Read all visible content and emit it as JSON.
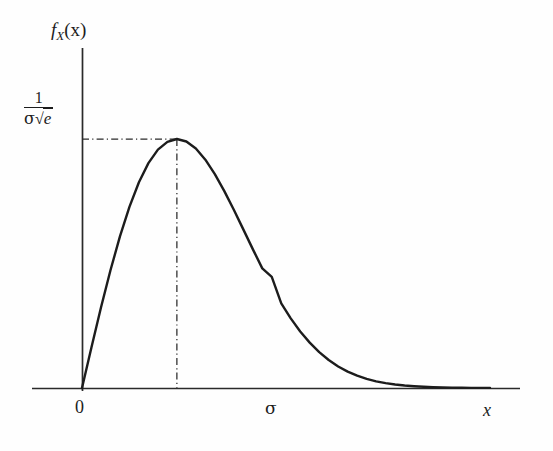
{
  "figure": {
    "background_color": "#fefefe",
    "ink_color": "#1c1c1c",
    "width": 553,
    "height": 451
  },
  "axes": {
    "y_axis_label": "f_X(x)",
    "y_axis_label_parts": {
      "f": "f",
      "subscript": "X",
      "argument": "(x)"
    },
    "x_axis_label": "x",
    "x_tick_labels": [
      "0",
      "σ"
    ],
    "y_tick_labels": [
      "1/(σ√e)"
    ],
    "y_tick_fraction": {
      "numerator": "1",
      "denominator_sigma": "σ",
      "denominator_radical": "√",
      "denominator_radicand": "e"
    },
    "origin_px": {
      "x": 82,
      "y": 388
    },
    "x_axis_span_px": {
      "x0": 32,
      "x1": 520
    },
    "y_axis_span_px": {
      "y0": 48,
      "y1": 392
    }
  },
  "guides": {
    "horizontal_guide_label": "peak-height-guide",
    "vertical_guide_label": "mode-guide",
    "style": "dash-dot",
    "peak_px": {
      "x": 272,
      "y": 139
    }
  },
  "chart_data": {
    "type": "line",
    "title": "",
    "subtitle": "",
    "xlabel": "x",
    "ylabel": "f_X(x)",
    "function": "f_X(x) = (x/sigma^2) * exp(-x^2/(2*sigma^2)), x >= 0",
    "xlim": [
      0,
      4.3
    ],
    "ylim": [
      0,
      0.72
    ],
    "grid": false,
    "legend": false,
    "annotations": [
      {
        "text": "σ",
        "x": 1.0,
        "y": 0,
        "role": "x-tick-mode"
      },
      {
        "text": "0",
        "x": 0.0,
        "y": 0,
        "role": "x-tick-origin"
      },
      {
        "text": "1/(σ√e)",
        "x": 0.0,
        "y": 0.6065,
        "role": "y-tick-peak"
      }
    ],
    "series": [
      {
        "name": "Rayleigh pdf (sigma = 1)",
        "color": "#1c1c1c",
        "x": [
          0.0,
          0.1,
          0.2,
          0.3,
          0.4,
          0.5,
          0.6,
          0.7,
          0.8,
          0.9,
          1.0,
          1.1,
          1.2,
          1.3,
          1.4,
          1.5,
          1.6,
          1.7,
          1.8,
          1.9,
          2.0,
          2.1,
          2.2,
          2.3,
          2.4,
          2.5,
          2.6,
          2.7,
          2.8,
          2.9,
          3.0,
          3.1,
          3.2,
          3.3,
          3.4,
          3.5,
          3.6,
          3.7,
          3.8,
          3.9,
          4.0,
          4.1,
          4.2,
          4.3
        ],
        "values": [
          0.0,
          0.0995,
          0.196,
          0.2868,
          0.3692,
          0.4412,
          0.5011,
          0.5477,
          0.5805,
          0.5994,
          0.6065,
          0.6004,
          0.5832,
          0.5561,
          0.5208,
          0.4795,
          0.434,
          0.3864,
          0.3383,
          0.2914,
          0.2707,
          0.206,
          0.1696,
          0.1378,
          0.1105,
          0.0873,
          0.0681,
          0.0524,
          0.0398,
          0.0299,
          0.0222,
          0.0163,
          0.0118,
          0.0085,
          0.006,
          0.0042,
          0.0029,
          0.002,
          0.0014,
          0.0009,
          0.0006,
          0.0004,
          0.0003,
          0.0002
        ]
      }
    ],
    "reference_lines": [
      {
        "orientation": "horizontal",
        "value": 0.6065,
        "from_x": 0.0,
        "to_x": 1.0,
        "style": "dash-dot",
        "label": "1/(σ√e)"
      },
      {
        "orientation": "vertical",
        "value": 1.0,
        "from_y": 0.0,
        "to_y": 0.6065,
        "style": "dash-dot",
        "label": "σ"
      }
    ]
  }
}
